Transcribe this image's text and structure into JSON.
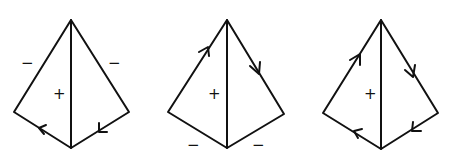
{
  "diagrams": [
    {
      "name": "kite-1",
      "vertices": {
        "apex": [
          71,
          20
        ],
        "left": [
          14,
          112
        ],
        "right": [
          129,
          112
        ],
        "bottom": [
          71,
          148
        ]
      },
      "labels": {
        "center": "+",
        "left_upper": "−",
        "right_upper": "−"
      },
      "arrows": [
        "left-bottom edge: pointing up-left toward left vertex",
        "right-bottom edge: pointing down-left toward bottom vertex"
      ]
    },
    {
      "name": "kite-2",
      "vertices": {
        "apex": [
          227,
          20
        ],
        "left": [
          168,
          112
        ],
        "right": [
          284,
          114
        ],
        "bottom": [
          227,
          148
        ]
      },
      "labels": {
        "center": "+",
        "left_lower": "−",
        "right_lower": "−"
      },
      "arrows": [
        "left-upper edge: pointing up toward apex",
        "right-upper edge: pointing down toward right vertex"
      ]
    },
    {
      "name": "kite-3",
      "vertices": {
        "apex": [
          381,
          20
        ],
        "left": [
          323,
          113
        ],
        "right": [
          438,
          113
        ],
        "bottom": [
          381,
          149
        ]
      },
      "labels": {
        "center": "+"
      },
      "arrows": [
        "left-upper edge: up toward apex",
        "right-upper edge: down toward right vertex",
        "right-lower edge: down-left toward bottom",
        "left-lower edge: up-left toward left vertex"
      ]
    }
  ]
}
